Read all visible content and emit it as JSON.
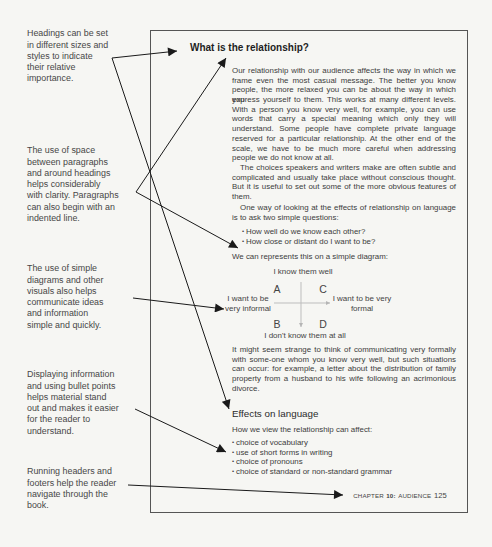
{
  "annotations": [
    {
      "text": "Headings can be set\nin different sizes and\nstyles to indicate\ntheir relative\nimportance."
    },
    {
      "text": "The use of space\nbetween paragraphs\nand around headings\nhelps considerably\nwith clarity. Paragraphs\ncan also begin with an\nindented line."
    },
    {
      "text": "The use of simple\ndiagrams and other\nvisuals also helps\ncommunicate ideas\nand information\nsimple and quickly."
    },
    {
      "text": "Displaying information\nand using bullet points\nhelps material stand\nout and makes it easier\nfor the reader to\nunderstand."
    },
    {
      "text": "Running headers and\nfooters help the reader\nnavigate through the\nbook."
    }
  ],
  "page": {
    "heading": "What is the relationship?",
    "paragraph1": [
      "Our relationship with our audience affects the way in which we",
      "frame even the most casual message. The better you know",
      "people, the more relaxed you can be about the way in which you",
      "express yourself to them. This works at many different levels.",
      "With a person you know very well, for example, you can use",
      "words that carry a special meaning which only they will",
      "understand. Some people have complete private language",
      "reserved for a particular relationship. At the other end of the",
      "scale, we have to be much more careful when addressing",
      "people we do not know at all."
    ],
    "paragraph2": [
      "The choices speakers and writers make are often subtle and",
      "complicated and usually take place without conscious thought.",
      "But it is useful to set out some of the more obvious features of",
      "them."
    ],
    "paragraph3": [
      "One way of looking at the effects of relationship on language",
      "is to ask two simple questions:"
    ],
    "bullet": "•",
    "questions": [
      "How well do we know each other?",
      "How close or distant do I want to be?"
    ],
    "diagram_intro": "We can represents this on a simple diagram:",
    "diagram": {
      "top": "I know them well",
      "bottom": "I don't know them at all",
      "left": "I want to be\nvery informal",
      "right": "I want to be very\nformal",
      "quadrants": {
        "top_left": "A",
        "top_right": "C",
        "bottom_left": "B",
        "bottom_right": "D"
      }
    },
    "paragraph4": [
      "It might seem strange to think of communicating very formally",
      "with some-one whom you know very well, but such situations",
      "can occur: for example, a letter about the distribution of family",
      "property from a husband to his wife following an acrimonious",
      "divorce."
    ],
    "subheading": "Effects on language",
    "effects_intro": "How we view the relationship can affect:",
    "effects": [
      "choice of vocabulary",
      "use of short forms in writing",
      "choice of pronouns",
      "choice of standard or non-standard grammar"
    ],
    "footer": {
      "chapter_label": "CHAPTER",
      "chapter_number": "10:",
      "chapter_title": "AUDIENCE",
      "page_number": "125"
    }
  }
}
